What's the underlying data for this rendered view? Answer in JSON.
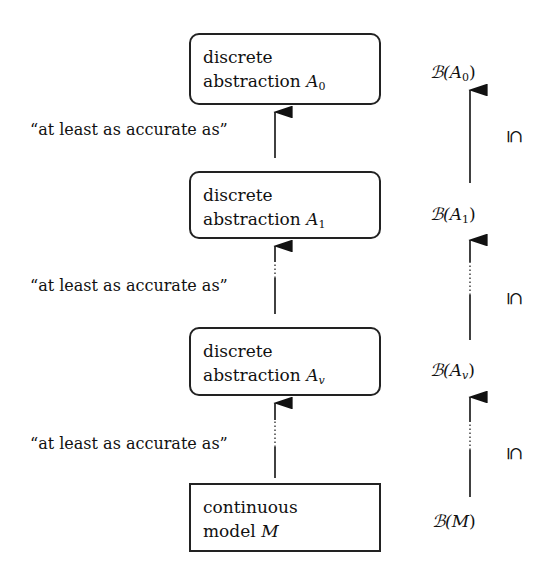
{
  "diagram": {
    "boxes": [
      {
        "line1": "discrete",
        "line2": "abstraction ",
        "symbol": "A",
        "sub": "0",
        "shape": "rounded"
      },
      {
        "line1": "discrete",
        "line2": "abstraction ",
        "symbol": "A",
        "sub": "1",
        "shape": "rounded"
      },
      {
        "line1": "discrete",
        "line2": "abstraction ",
        "symbol": "A",
        "sub": "v",
        "shape": "rounded"
      },
      {
        "line1": "continuous",
        "line2": "model ",
        "symbol": "M",
        "sub": "",
        "shape": "rectangle"
      }
    ],
    "relation_labels": [
      "“at least as accurate as”",
      "“at least as accurate as”",
      "“at least as accurate as”"
    ],
    "behaviors": [
      {
        "prefix": "ℬ(",
        "symbol": "A",
        "sub": "0",
        "suffix": ")"
      },
      {
        "prefix": "ℬ(",
        "symbol": "A",
        "sub": "1",
        "suffix": ")"
      },
      {
        "prefix": "ℬ(",
        "symbol": "A",
        "sub": "v",
        "suffix": ")"
      },
      {
        "prefix": "ℬ(",
        "symbol": "M",
        "sub": "",
        "suffix": ")"
      }
    ],
    "inclusion_symbol": "⊆",
    "edges": [
      {
        "from": "A1",
        "to": "A0",
        "style": "solid"
      },
      {
        "from": "Av",
        "to": "A1",
        "style": "dotted-gap"
      },
      {
        "from": "M",
        "to": "Av",
        "style": "dotted-gap"
      }
    ]
  }
}
